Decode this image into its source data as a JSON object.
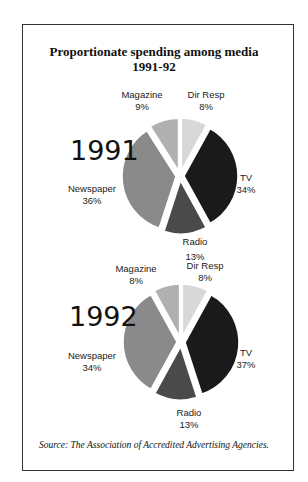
{
  "title_line1": "Proportionate spending among media",
  "title_line2": "1991-92",
  "source": "Source: The Association of Accredited Advertising Agencies.",
  "colors": {
    "Dir Resp": "#d8d8d8",
    "TV": "#1a1a1a",
    "Radio": "#4a4a4a",
    "Newspaper": "#8a8a8a",
    "Magazine": "#b0b0b0"
  },
  "pies": [
    {
      "year": "1991",
      "labels": {
        "magazine": {
          "name": "Magazine",
          "pct": "9%"
        },
        "dirresp": {
          "name": "Dir Resp",
          "pct": "8%"
        },
        "tv": {
          "name": "TV",
          "pct": "34%"
        },
        "newspaper": {
          "name": "Newspaper",
          "pct": "36%"
        },
        "radio": {
          "name": "Radio",
          "pct": "13%"
        }
      }
    },
    {
      "year": "1992",
      "labels": {
        "magazine": {
          "name": "Magazine",
          "pct": "8%"
        },
        "dirresp": {
          "name": "Dir Resp",
          "pct": "8%"
        },
        "tv": {
          "name": "TV",
          "pct": "37%"
        },
        "newspaper": {
          "name": "Newspaper",
          "pct": "34%"
        },
        "radio": {
          "name": "Radio",
          "pct": "13%"
        }
      }
    }
  ],
  "chart_data": [
    {
      "type": "pie",
      "title": "Proportionate spending among media 1991-92",
      "subtitle": "1991",
      "categories": [
        "Dir Resp",
        "TV",
        "Radio",
        "Newspaper",
        "Magazine"
      ],
      "values": [
        8,
        34,
        13,
        36,
        9
      ],
      "unit": "%",
      "exploded": true,
      "legend": "inline labels"
    },
    {
      "type": "pie",
      "title": "Proportionate spending among media 1991-92",
      "subtitle": "1992",
      "categories": [
        "Dir Resp",
        "TV",
        "Radio",
        "Newspaper",
        "Magazine"
      ],
      "values": [
        8,
        37,
        13,
        34,
        8
      ],
      "unit": "%",
      "exploded": true,
      "legend": "inline labels"
    }
  ]
}
